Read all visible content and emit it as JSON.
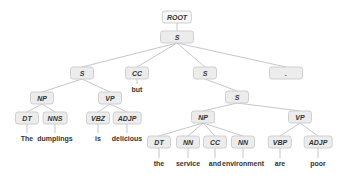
{
  "diagram": {
    "type": "constituency-parse-tree",
    "nodes": [
      {
        "id": "root",
        "label": "ROOT",
        "x": 177,
        "y": 17,
        "kind": "root"
      },
      {
        "id": "s0",
        "label": "S",
        "x": 177,
        "y": 37,
        "kind": "wide"
      },
      {
        "id": "s1",
        "label": "S",
        "x": 82,
        "y": 73
      },
      {
        "id": "cc1",
        "label": "CC",
        "x": 137,
        "y": 73
      },
      {
        "id": "s2",
        "label": "S",
        "x": 205,
        "y": 73
      },
      {
        "id": "punct",
        "label": ".",
        "x": 286,
        "y": 73,
        "kind": "wide"
      },
      {
        "id": "np1",
        "label": "NP",
        "x": 42,
        "y": 98
      },
      {
        "id": "vp1",
        "label": "VP",
        "x": 110,
        "y": 98
      },
      {
        "id": "s3",
        "label": "S",
        "x": 237,
        "y": 97
      },
      {
        "id": "dt1",
        "label": "DT",
        "x": 27,
        "y": 118
      },
      {
        "id": "nns1",
        "label": "NNS",
        "x": 55,
        "y": 118
      },
      {
        "id": "vbz1",
        "label": "VBZ",
        "x": 98,
        "y": 118
      },
      {
        "id": "adjp1",
        "label": "ADJP",
        "x": 127,
        "y": 118
      },
      {
        "id": "np2",
        "label": "NP",
        "x": 203,
        "y": 117
      },
      {
        "id": "vp2",
        "label": "VP",
        "x": 300,
        "y": 117
      },
      {
        "id": "dt2",
        "label": "DT",
        "x": 159,
        "y": 142
      },
      {
        "id": "nn2",
        "label": "NN",
        "x": 188,
        "y": 142
      },
      {
        "id": "cc2",
        "label": "CC",
        "x": 215,
        "y": 142
      },
      {
        "id": "nn3",
        "label": "NN",
        "x": 243,
        "y": 142
      },
      {
        "id": "vbp2",
        "label": "VBP",
        "x": 280,
        "y": 142
      },
      {
        "id": "adjp2",
        "label": "ADJP",
        "x": 318,
        "y": 142
      }
    ],
    "words": [
      {
        "id": "w_but",
        "text": "but",
        "x": 137,
        "y": 89,
        "parent": "cc1"
      },
      {
        "id": "w_the1",
        "text": "The",
        "x": 27,
        "y": 138,
        "parent": "dt1"
      },
      {
        "id": "w_dumplings",
        "text": "dumplings",
        "x": 55,
        "y": 138,
        "parent": "nns1"
      },
      {
        "id": "w_is",
        "text": "is",
        "x": 98,
        "y": 138,
        "parent": "vbz1"
      },
      {
        "id": "w_delicious",
        "text": "delicious",
        "x": 127,
        "y": 138,
        "parent": "adjp1"
      },
      {
        "id": "w_the2",
        "text": "the",
        "x": 159,
        "y": 163,
        "parent": "dt2"
      },
      {
        "id": "w_service",
        "text": "service",
        "x": 188,
        "y": 163,
        "parent": "nn2"
      },
      {
        "id": "w_and",
        "text": "and",
        "x": 215,
        "y": 163,
        "parent": "cc2"
      },
      {
        "id": "w_environment",
        "text": "environment",
        "x": 243,
        "y": 163,
        "parent": "nn3"
      },
      {
        "id": "w_are",
        "text": "are",
        "x": 280,
        "y": 163,
        "parent": "vbp2"
      },
      {
        "id": "w_poor",
        "text": "poor",
        "x": 318,
        "y": 163,
        "parent": "adjp2"
      }
    ],
    "edges": [
      [
        "root",
        "s0"
      ],
      [
        "s0",
        "s1"
      ],
      [
        "s0",
        "cc1"
      ],
      [
        "s0",
        "s2"
      ],
      [
        "s0",
        "punct"
      ],
      [
        "s1",
        "np1"
      ],
      [
        "s1",
        "vp1"
      ],
      [
        "np1",
        "dt1"
      ],
      [
        "np1",
        "nns1"
      ],
      [
        "vp1",
        "vbz1"
      ],
      [
        "vp1",
        "adjp1"
      ],
      [
        "s2",
        "s3"
      ],
      [
        "s3",
        "np2"
      ],
      [
        "s3",
        "vp2"
      ],
      [
        "np2",
        "dt2"
      ],
      [
        "np2",
        "nn2"
      ],
      [
        "np2",
        "cc2"
      ],
      [
        "np2",
        "nn3"
      ],
      [
        "vp2",
        "vbp2"
      ],
      [
        "vp2",
        "adjp2"
      ]
    ],
    "colors": {
      "edge": "#b8b8b8",
      "node_fill": "#ececec",
      "node_border": "#cfcfcf",
      "text": "#333333"
    }
  }
}
